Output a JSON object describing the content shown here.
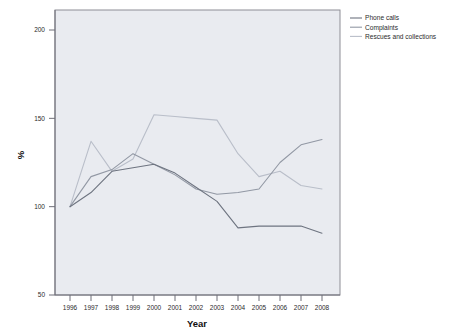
{
  "chart_data": {
    "type": "line",
    "title": "",
    "xlabel": "Year",
    "ylabel": "%",
    "x": [
      1996,
      1997,
      1998,
      1999,
      2000,
      2001,
      2002,
      2003,
      2004,
      2005,
      2006,
      2007,
      2008
    ],
    "categories": [
      "1996",
      "1997",
      "1998",
      "1999",
      "2000",
      "2001",
      "2002",
      "2003",
      "2004",
      "2005",
      "2006",
      "2007",
      "2008"
    ],
    "xtick_labels": [
      "1996",
      "1997",
      "1998",
      "1999",
      "2000",
      "2001",
      "2002",
      "2003",
      "2004",
      "2005",
      "2006",
      "2007",
      "2008"
    ],
    "ytick_labels": [
      "50",
      "100",
      "150",
      "200"
    ],
    "yticks": [
      50,
      100,
      150,
      200
    ],
    "ylim": [
      50,
      210
    ],
    "xlim": [
      1995.4,
      2008.8
    ],
    "grid": false,
    "legend_position": "top-right-outside",
    "series": [
      {
        "name": "Phone calls",
        "color": "#6e7480",
        "values": [
          100,
          108,
          120,
          122,
          124,
          119,
          111,
          103,
          88,
          89,
          89,
          89,
          85
        ]
      },
      {
        "name": "Complaints",
        "color": "#9298a4",
        "values": [
          100,
          117,
          121,
          130,
          124,
          118,
          110,
          107,
          108,
          110,
          125,
          135,
          138
        ]
      },
      {
        "name": "Rescues and collections",
        "color": "#b9bec9",
        "values": [
          100,
          137,
          120,
          127,
          152,
          151,
          150,
          149,
          130,
          117,
          120,
          112,
          110
        ]
      }
    ]
  },
  "legend": {
    "items": [
      {
        "label": "Phone calls",
        "color": "#6e7480"
      },
      {
        "label": "Complaints",
        "color": "#9298a4"
      },
      {
        "label": "Rescues and collections",
        "color": "#b9bec9"
      }
    ]
  },
  "axes": {
    "y_title": "%",
    "x_title": "Year"
  },
  "colors": {
    "plot_background": "#e9ebf0",
    "page_background": "#ffffff",
    "frame": "#8e8e96",
    "text": "#2b2b2b"
  }
}
